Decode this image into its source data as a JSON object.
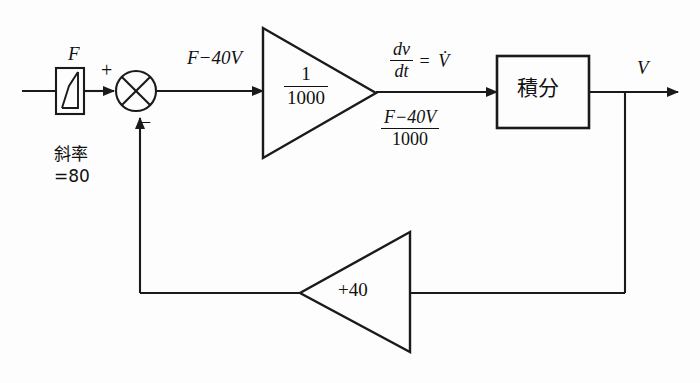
{
  "diagram": {
    "line_color": "#1a1a1a",
    "background_color": "#fdfdfd",
    "input_block": {
      "signal_label": "F",
      "symbol": "ramp",
      "annotation_line1": "斜率",
      "annotation_line2": "=80"
    },
    "summing_junction": {
      "plus_sign": "+",
      "minus_sign": "−"
    },
    "error_signal": "F−40V",
    "main_gain": {
      "numerator": "1",
      "denominator": "1000"
    },
    "derivative_label": {
      "numerator": "dv",
      "denominator": "dt",
      "equals": "=",
      "result": "V̇"
    },
    "error_over_gain": {
      "numerator": "F−40V",
      "denominator": "1000"
    },
    "integrator_block": {
      "label": "積分"
    },
    "output_signal": "V",
    "feedback_gain": "+40"
  }
}
